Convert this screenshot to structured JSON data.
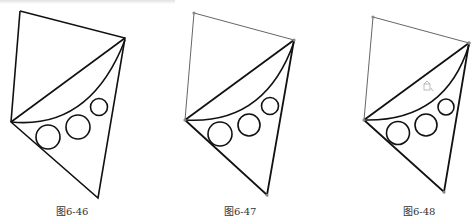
{
  "figures": [
    {
      "caption": "图6-46",
      "style": "plain"
    },
    {
      "caption": "图6-47",
      "style": "vertices"
    },
    {
      "caption": "图6-48",
      "style": "vertices-cursor"
    }
  ],
  "colors": {
    "stroke": "#111111",
    "thin": "#666666",
    "vertex": "#888888"
  }
}
